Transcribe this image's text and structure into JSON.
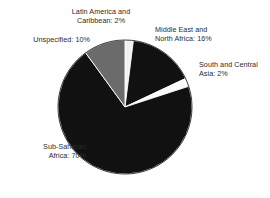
{
  "chart_data": {
    "type": "pie",
    "title": "",
    "subtitle": "",
    "xlabel": "",
    "ylabel": "",
    "legend_position": "none",
    "grid": false,
    "labels_inline": true,
    "total": 100,
    "units": "%",
    "categories": [
      "Latin America and Caribbean",
      "Middle East and North Africa",
      "South and Central Asia",
      "Sub-Saharan Africa",
      "Unspecified"
    ],
    "values": [
      2,
      16,
      2,
      70,
      10
    ],
    "colors": [
      "#f2f2f2",
      "#111111",
      "#fbfbfb",
      "#111111",
      "#6b6b6b"
    ],
    "slices": [
      {
        "name": "Latin America and Caribbean",
        "value": 2,
        "color": "#f2f2f2",
        "label": "Latin America and\nCaribbean: 2%",
        "start_pct": 0,
        "end_pct": 2
      },
      {
        "name": "Middle East and North Africa",
        "value": 16,
        "color": "#111111",
        "label": "Middle East and\nNorth Africa: 16%",
        "start_pct": 2,
        "end_pct": 18
      },
      {
        "name": "South and Central Asia",
        "value": 2,
        "color": "#fbfbfb",
        "label": "South and Central\nAsia: 2%",
        "start_pct": 18,
        "end_pct": 20
      },
      {
        "name": "Sub-Saharan Africa",
        "value": 70,
        "color": "#111111",
        "label": "Sub-Saharan\nAfrica: 70%",
        "start_pct": 20,
        "end_pct": 90
      },
      {
        "name": "Unspecified",
        "value": 10,
        "color": "#6b6b6b",
        "label": "Unspecified: 10%",
        "start_pct": 90,
        "end_pct": 100
      }
    ],
    "geometry": {
      "cx": 125,
      "cy": 107,
      "r": 67,
      "start_angle_deg": -90,
      "direction": "clockwise"
    },
    "background": "#fefefe",
    "label_color": "#2b2b2b"
  }
}
